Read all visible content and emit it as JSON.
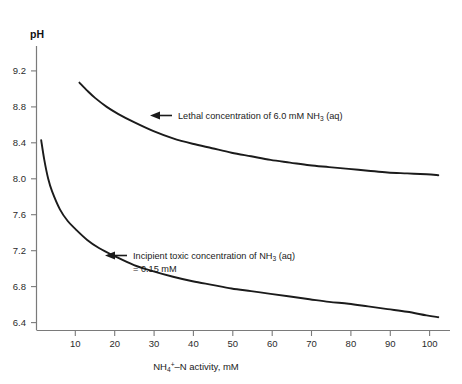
{
  "chart_data": {
    "type": "line",
    "title": "",
    "xlabel": "NH4+ -N activity, mM",
    "ylabel": "pH",
    "xlim": [
      0,
      106
    ],
    "ylim": [
      6.4,
      9.35
    ],
    "grid": false,
    "legend_position": "none",
    "xticks": [
      10,
      20,
      30,
      40,
      50,
      60,
      70,
      80,
      90,
      100
    ],
    "xtick_labels": [
      "10",
      "20",
      "30",
      "40",
      "50",
      "60",
      "70",
      "80",
      "90",
      "100"
    ],
    "yticks": [
      6.4,
      6.8,
      7.2,
      7.6,
      8.0,
      8.4,
      8.8,
      9.2
    ],
    "ytick_labels": [
      "6.4",
      "6.8",
      "7.2",
      "7.6",
      "8.0",
      "8.4",
      "8.8",
      "9.2"
    ],
    "series": [
      {
        "name": "Lethal concentration of 6.0 mM NH3 (aq)",
        "x": [
          11,
          13,
          15,
          18,
          21,
          25,
          30,
          35,
          40,
          45,
          50,
          55,
          60,
          65,
          70,
          75,
          80,
          85,
          90,
          95,
          100,
          103
        ],
        "y": [
          9.07,
          8.98,
          8.9,
          8.8,
          8.72,
          8.63,
          8.53,
          8.45,
          8.39,
          8.34,
          8.29,
          8.25,
          8.21,
          8.18,
          8.15,
          8.13,
          8.11,
          8.09,
          8.07,
          8.06,
          8.05,
          8.04
        ]
      },
      {
        "name": "Incipient toxic concentration of NH3 (aq) = 0.15 mM",
        "x": [
          1.2,
          2,
          3,
          4,
          6,
          8,
          10,
          13,
          16,
          20,
          25,
          30,
          35,
          40,
          45,
          50,
          55,
          60,
          65,
          70,
          75,
          80,
          85,
          90,
          95,
          100,
          103
        ],
        "y": [
          8.43,
          8.21,
          8.0,
          7.86,
          7.66,
          7.53,
          7.44,
          7.32,
          7.23,
          7.14,
          7.04,
          6.97,
          6.91,
          6.86,
          6.82,
          6.78,
          6.75,
          6.72,
          6.69,
          6.66,
          6.63,
          6.61,
          6.58,
          6.55,
          6.52,
          6.48,
          6.46
        ]
      }
    ],
    "annotations": [
      {
        "id": "lethal",
        "text_prefix": "Lethal concentration of 6.0 mM NH",
        "subscript": "3",
        "text_suffix": " (aq)",
        "text_line2": "",
        "arrow": "left"
      },
      {
        "id": "incipient",
        "text_prefix": "Incipient toxic concentration of NH",
        "subscript": "3",
        "text_suffix": " (aq)",
        "text_line2": "= 0.15 mM",
        "arrow": "left"
      }
    ]
  },
  "axis": {
    "y_title": "pH",
    "x_title_prefix": "NH",
    "x_title_sub": "4",
    "x_title_sup": "+",
    "x_title_suffix": "–N activity, mM"
  }
}
